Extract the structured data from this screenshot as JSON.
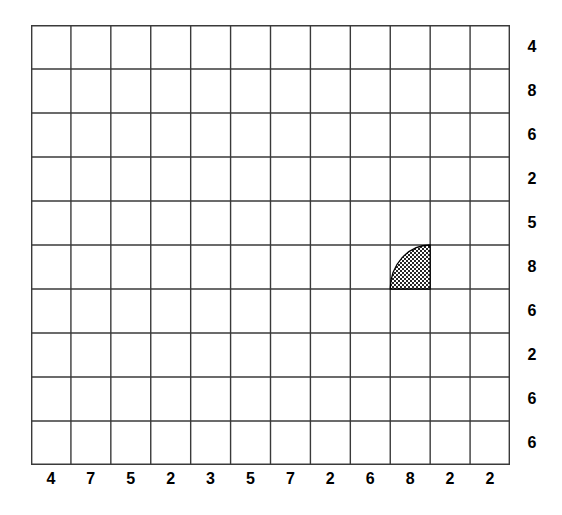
{
  "figure": {
    "kind": "grid-diagram",
    "background_color": "#ffffff",
    "grid_line_color": "#3a3a3a",
    "label_color": "#000000",
    "shape_fill_color": "#000000"
  },
  "grid": {
    "columns": 12,
    "rows": 10,
    "left_px": 31,
    "top_px": 25,
    "width_px": 479,
    "height_px": 440,
    "cell_width_px": 39.92,
    "cell_height_px": 44,
    "line_width_px": 1.4
  },
  "column_labels": [
    "4",
    "7",
    "5",
    "2",
    "3",
    "5",
    "7",
    "2",
    "6",
    "8",
    "2",
    "2"
  ],
  "row_labels": [
    "4",
    "8",
    "6",
    "2",
    "5",
    "8",
    "6",
    "2",
    "6",
    "6"
  ],
  "shapes": [
    {
      "name": "hatched-quarter-circle",
      "type": "quarter-circle",
      "column_index": 10,
      "row_index": 6,
      "column_label": "8",
      "row_label": "8",
      "corner": "bottom-right",
      "fill": "crosshatch",
      "outline_color": "#000000"
    }
  ],
  "chart_data": {
    "type": "heatmap",
    "title": "",
    "xlabel": "",
    "ylabel": "",
    "x": [
      "4",
      "7",
      "5",
      "2",
      "3",
      "5",
      "7",
      "2",
      "6",
      "8",
      "2",
      "2"
    ],
    "categories": [
      "4",
      "8",
      "6",
      "2",
      "5",
      "8",
      "6",
      "2",
      "6",
      "6"
    ],
    "grid": true,
    "legend": "none",
    "annotations": [
      {
        "label": "shaded quarter-circle",
        "column": 10,
        "row": 6,
        "column_label": "8",
        "row_label": "8"
      }
    ],
    "values": [
      [
        0,
        0,
        0,
        0,
        0,
        0,
        0,
        0,
        0,
        0,
        0,
        0
      ],
      [
        0,
        0,
        0,
        0,
        0,
        0,
        0,
        0,
        0,
        0,
        0,
        0
      ],
      [
        0,
        0,
        0,
        0,
        0,
        0,
        0,
        0,
        0,
        0,
        0,
        0
      ],
      [
        0,
        0,
        0,
        0,
        0,
        0,
        0,
        0,
        0,
        0,
        0,
        0
      ],
      [
        0,
        0,
        0,
        0,
        0,
        0,
        0,
        0,
        0,
        0,
        0,
        0
      ],
      [
        0,
        0,
        0,
        0,
        0,
        0,
        0,
        0,
        0,
        1,
        0,
        0
      ],
      [
        0,
        0,
        0,
        0,
        0,
        0,
        0,
        0,
        0,
        0,
        0,
        0
      ],
      [
        0,
        0,
        0,
        0,
        0,
        0,
        0,
        0,
        0,
        0,
        0,
        0
      ],
      [
        0,
        0,
        0,
        0,
        0,
        0,
        0,
        0,
        0,
        0,
        0,
        0
      ],
      [
        0,
        0,
        0,
        0,
        0,
        0,
        0,
        0,
        0,
        0,
        0,
        0
      ]
    ]
  }
}
